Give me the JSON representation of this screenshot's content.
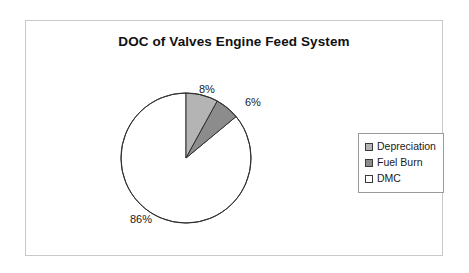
{
  "chart_data": {
    "type": "pie",
    "title": "DOC of Valves Engine Feed System",
    "categories": [
      "Depreciation",
      "Fuel Burn",
      "DMC"
    ],
    "values": [
      8,
      6,
      86
    ],
    "value_labels": [
      "8%",
      "6%",
      "86%"
    ],
    "unit": "percent",
    "start_angle_deg": 0,
    "direction": "clockwise",
    "colors": [
      "#b4b4b4",
      "#8c8c8c",
      "#ffffff"
    ],
    "slice_outline_color": "#303030",
    "legend": {
      "position": "right",
      "entries": [
        {
          "label": "Depreciation",
          "color": "#b4b4b4"
        },
        {
          "label": "Fuel Burn",
          "color": "#8c8c8c"
        },
        {
          "label": "DMC",
          "color": "#ffffff"
        }
      ]
    },
    "xlabel": "",
    "ylabel": "",
    "grid": false
  },
  "frame": {
    "border_color": "#c9c9c9",
    "background": "#ffffff"
  }
}
